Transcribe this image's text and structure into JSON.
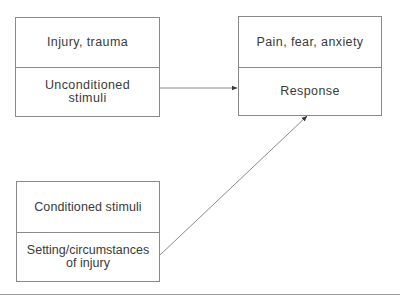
{
  "diagram": {
    "type": "classical-conditioning-flow",
    "boxes": [
      {
        "id": "unconditioned",
        "top": "Injury, trauma",
        "bottom": "Unconditioned stimuli"
      },
      {
        "id": "response",
        "top": "Pain, fear, anxiety",
        "bottom": "Response"
      },
      {
        "id": "conditioned",
        "top": "Conditioned stimuli",
        "bottom": "Setting/circumstances of injury"
      }
    ],
    "edges": [
      {
        "from": "unconditioned",
        "to": "response",
        "arrow": true
      },
      {
        "from": "conditioned",
        "to": "response",
        "arrow": true
      }
    ],
    "colors": {
      "line": "#8a8a8a",
      "text": "#3a3a3a",
      "background": "#ffffff"
    }
  }
}
